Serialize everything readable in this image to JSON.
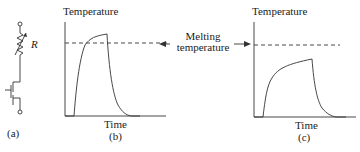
{
  "circuit": {
    "resistor_label": "R",
    "panel_label": "(a)"
  },
  "panel_b": {
    "y_axis_label": "Temperature",
    "x_axis_label": "Time",
    "panel_label": "(b)"
  },
  "panel_c": {
    "y_axis_label": "Temperature",
    "x_axis_label": "Time",
    "panel_label": "(c)"
  },
  "annotation": {
    "line1": "Melting",
    "line2": "temperature"
  },
  "colors": {
    "stroke": "#333333",
    "text": "#222222"
  }
}
